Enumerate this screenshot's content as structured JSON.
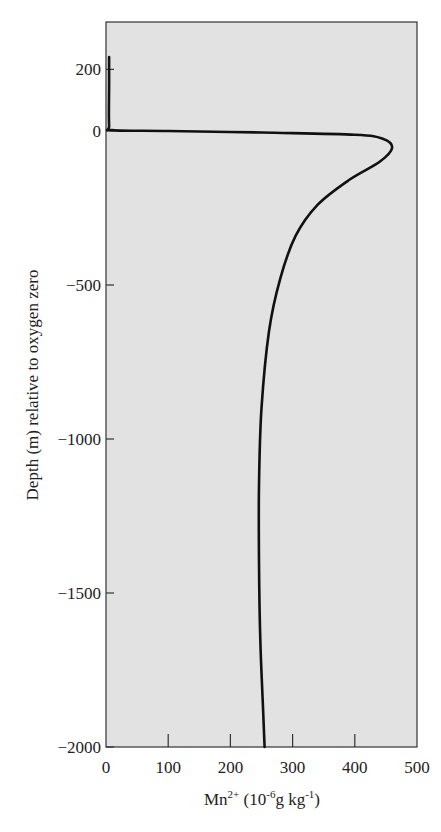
{
  "chart_data": {
    "type": "line",
    "title": "",
    "xlabel": "Mn2+ (10-6g kg-1)",
    "xlabel_parts": {
      "base": "Mn",
      "sup1": "2+",
      "mid": " (10",
      "sup2": "-6",
      "mid2": "g kg",
      "sup3": "-1",
      "end": ")"
    },
    "ylabel": "Depth (m) relative to oxygen zero",
    "xlim": [
      0,
      500
    ],
    "ylim": [
      -2000,
      260
    ],
    "xticks": [
      0,
      100,
      200,
      300,
      400,
      500
    ],
    "yticks": [
      200,
      0,
      -500,
      -1000,
      -1500,
      -2000
    ],
    "ytick_labels": [
      "200",
      "0",
      "−500",
      "−1000",
      "−1500",
      "−2000"
    ],
    "grid": false,
    "legend": null,
    "background": "#e2e2e2",
    "line_color": "#111111",
    "series": [
      {
        "name": "Mn2+ profile",
        "points": [
          {
            "x": 5,
            "y": 240
          },
          {
            "x": 5,
            "y": 150
          },
          {
            "x": 5,
            "y": 20
          },
          {
            "x": 10,
            "y": 3
          },
          {
            "x": 100,
            "y": 0
          },
          {
            "x": 250,
            "y": -5
          },
          {
            "x": 400,
            "y": -12
          },
          {
            "x": 445,
            "y": -25
          },
          {
            "x": 460,
            "y": -55
          },
          {
            "x": 440,
            "y": -100
          },
          {
            "x": 390,
            "y": -160
          },
          {
            "x": 340,
            "y": -240
          },
          {
            "x": 305,
            "y": -340
          },
          {
            "x": 280,
            "y": -480
          },
          {
            "x": 262,
            "y": -650
          },
          {
            "x": 250,
            "y": -900
          },
          {
            "x": 246,
            "y": -1150
          },
          {
            "x": 246,
            "y": -1400
          },
          {
            "x": 248,
            "y": -1650
          },
          {
            "x": 252,
            "y": -1850
          },
          {
            "x": 255,
            "y": -2000
          }
        ]
      }
    ]
  }
}
